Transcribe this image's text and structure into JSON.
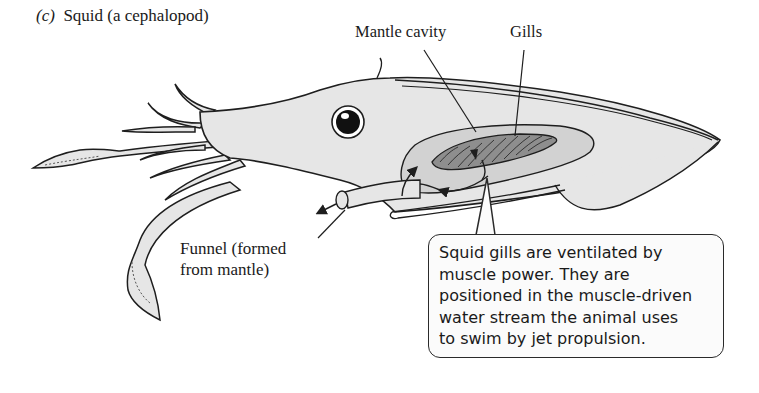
{
  "figure": {
    "panel_letter": "(c)",
    "title": "Squid (a cephalopod)"
  },
  "labels": {
    "mantle_cavity": "Mantle cavity",
    "gills": "Gills",
    "funnel_line1": "Funnel (formed",
    "funnel_line2": "from mantle)"
  },
  "callout": {
    "lines": [
      "Squid gills are ventilated by",
      "muscle power. They are",
      "positioned in the muscle-driven",
      "water stream the animal uses",
      "to swim by jet propulsion."
    ]
  },
  "colors": {
    "body_fill": "#e6e6e6",
    "cavity_fill": "#d2d2d2",
    "gill_fill": "#8e8e8e",
    "outline": "#1e1e1e",
    "callout_bg": "#fbfbfb"
  }
}
